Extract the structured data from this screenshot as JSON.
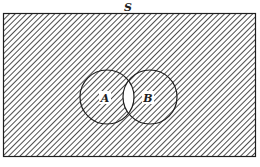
{
  "diagram": {
    "type": "venn",
    "universe_label": "S",
    "sets": [
      {
        "id": "A",
        "label": "A"
      },
      {
        "id": "B",
        "label": "B"
      }
    ],
    "shaded_regions": [
      "S minus (A ∩ B)"
    ],
    "unshaded_regions": [
      "A ∩ B"
    ],
    "colors": {
      "line": "#1e1e1e",
      "hatch": "#3a3a3a",
      "background": "#ffffff"
    }
  }
}
